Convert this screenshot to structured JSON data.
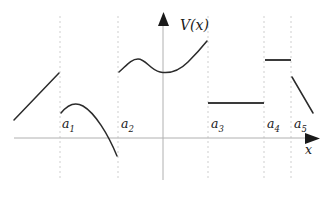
{
  "figure": {
    "caption_title": "V(x)",
    "axis_labels": {
      "y": "V(x)",
      "x": "x"
    },
    "boundary_labels": [
      {
        "name": "a",
        "sub": "1"
      },
      {
        "name": "a",
        "sub": "2"
      },
      {
        "name": "a",
        "sub": "3"
      },
      {
        "name": "a",
        "sub": "4"
      },
      {
        "name": "a",
        "sub": "5"
      }
    ],
    "colors": {
      "curve": "#2b2b2b",
      "flat_step": "#3a3a3a",
      "axis": "#b0b0b0",
      "divider": "#cfcfcf",
      "background": "#ffffff",
      "text": "#1a1a1a"
    }
  },
  "chart_data": {
    "type": "line",
    "title": "V(x)",
    "xlabel": "x",
    "ylabel": "V(x)",
    "grid": false,
    "legend": null,
    "axis": {
      "x_axis_y_pixel": 138,
      "y_axis_x_pixel": 163,
      "x_axis_from_pixel": 14,
      "x_axis_to_pixel": 318,
      "y_axis_from_pixel": 180,
      "y_axis_to_pixel": 16
    },
    "boundaries": [
      {
        "label": "a1",
        "x_pixel": 60
      },
      {
        "label": "a2",
        "x_pixel": 118
      },
      {
        "label": "a3",
        "x_pixel": 208
      },
      {
        "label": "a4",
        "x_pixel": 264
      },
      {
        "label": "a5",
        "x_pixel": 291
      }
    ],
    "series": [
      {
        "name": "branch-1",
        "interval": "x < a1",
        "shape": "straight rising line",
        "path": "M 14 120 L 59 73",
        "points": [
          [
            14,
            120
          ],
          [
            59,
            73
          ]
        ]
      },
      {
        "name": "branch-2",
        "interval": "a1 < x < a2",
        "shape": "concave-down arc peaking then falling steeply",
        "path": "M 61 113 C 69 103, 76 102, 83 106 C 95 113, 108 134, 117 156",
        "points": [
          [
            61,
            113
          ],
          [
            80,
            104
          ],
          [
            100,
            124
          ],
          [
            117,
            156
          ]
        ]
      },
      {
        "name": "branch-3",
        "interval": "a2 < x < a3",
        "shape": "wavy curve: local max, local min, then rising",
        "path": "M 119 72 C 126 66, 131 59, 138 59 C 146 59, 150 70, 160 72 C 170 74, 179 71, 188 62 C 197 53, 203 46, 207 41",
        "points": [
          [
            119,
            72
          ],
          [
            138,
            59
          ],
          [
            160,
            72
          ],
          [
            172,
            73
          ],
          [
            190,
            60
          ],
          [
            207,
            41
          ]
        ]
      },
      {
        "name": "branch-4",
        "interval": "a3 < x < a4",
        "shape": "horizontal constant step",
        "path": "M 208 103 L 264 103",
        "points": [
          [
            208,
            103
          ],
          [
            264,
            103
          ]
        ]
      },
      {
        "name": "branch-5",
        "interval": "a4 < x < a5",
        "shape": "horizontal constant step, higher",
        "path": "M 265 60 L 291 60",
        "points": [
          [
            265,
            60
          ],
          [
            291,
            60
          ]
        ]
      },
      {
        "name": "branch-6",
        "interval": "x > a5",
        "shape": "straight falling line",
        "path": "M 292 77 L 313 113",
        "points": [
          [
            292,
            77
          ],
          [
            313,
            113
          ]
        ]
      }
    ]
  }
}
